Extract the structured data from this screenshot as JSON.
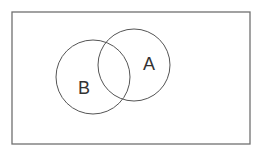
{
  "diagram": {
    "type": "venn",
    "universe": {
      "x": 12,
      "y": 12,
      "width": 238,
      "height": 132,
      "stroke": "#707070",
      "fill": "#ffffff"
    },
    "sets": [
      {
        "label": "A",
        "cx": 134,
        "cy": 65,
        "r": 36,
        "label_x": 149,
        "label_y": 70,
        "stroke": "#555555"
      },
      {
        "label": "B",
        "cx": 93,
        "cy": 77,
        "r": 37,
        "label_x": 84,
        "label_y": 94,
        "stroke": "#555555"
      }
    ]
  }
}
